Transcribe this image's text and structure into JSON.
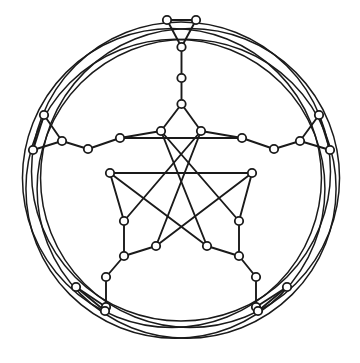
{
  "figure": {
    "kind": "graph-drawing",
    "background_color": "#ffffff",
    "stroke_color": "#1a1a1a",
    "node_fill_color": "#ffffff",
    "node_radius": 4.2,
    "edge_width": 1.9,
    "arc_width": 1.5,
    "symmetry_order": 5,
    "center": {
      "x": 181,
      "y": 181
    },
    "counts": {
      "nodes": 40,
      "straight_edges": 60,
      "arcs": 5
    }
  },
  "geometry": {
    "nodes": [
      {
        "id": "n0",
        "name": "top-tri-left",
        "x": 167.0,
        "y": 20.0
      },
      {
        "id": "n1",
        "name": "top-tri-right",
        "x": 196.0,
        "y": 20.0
      },
      {
        "id": "n2",
        "name": "top-tri-apex",
        "x": 181.5,
        "y": 47.0
      },
      {
        "id": "n3",
        "name": "top-spoke",
        "x": 181.5,
        "y": 78.0
      },
      {
        "id": "n4",
        "name": "star-tip-top",
        "x": 181.5,
        "y": 104.0
      },
      {
        "id": "n5",
        "name": "star-inner-tl",
        "x": 161.0,
        "y": 131.0
      },
      {
        "id": "n6",
        "name": "star-inner-tr",
        "x": 201.0,
        "y": 131.0
      },
      {
        "id": "n7",
        "name": "ring-a-upper-left",
        "x": 120.0,
        "y": 138.0
      },
      {
        "id": "n8",
        "name": "ring-a-upper-right",
        "x": 242.0,
        "y": 138.0
      },
      {
        "id": "n9",
        "name": "ring-b-left",
        "x": 110.0,
        "y": 173.0
      },
      {
        "id": "n10",
        "name": "ring-b-right",
        "x": 252.0,
        "y": 173.0
      },
      {
        "id": "n11",
        "name": "ring-c-lower-left",
        "x": 124.0,
        "y": 221.0
      },
      {
        "id": "n12",
        "name": "ring-c-lower-right",
        "x": 239.0,
        "y": 221.0
      },
      {
        "id": "n13",
        "name": "star-inner-bl",
        "x": 156.0,
        "y": 246.0
      },
      {
        "id": "n14",
        "name": "star-inner-br",
        "x": 207.0,
        "y": 246.0
      },
      {
        "id": "n15",
        "name": "ring-d-lower-left",
        "x": 124.0,
        "y": 256.0
      },
      {
        "id": "n16",
        "name": "ring-d-lower-right",
        "x": 239.0,
        "y": 256.0
      },
      {
        "id": "n17",
        "name": "hub-left-outer",
        "x": 88.0,
        "y": 149.0
      },
      {
        "id": "n18",
        "name": "hub-left-inner",
        "x": 62.0,
        "y": 141.0
      },
      {
        "id": "n19",
        "name": "hub-right-outer",
        "x": 274.0,
        "y": 149.0
      },
      {
        "id": "n20",
        "name": "hub-right-inner",
        "x": 300.0,
        "y": 141.0
      },
      {
        "id": "n21",
        "name": "left-tri-top",
        "x": 44.0,
        "y": 115.0
      },
      {
        "id": "n22",
        "name": "left-tri-bottom",
        "x": 33.0,
        "y": 150.0
      },
      {
        "id": "n23",
        "name": "right-tri-top",
        "x": 319.0,
        "y": 115.0
      },
      {
        "id": "n24",
        "name": "right-tri-bottom",
        "x": 330.0,
        "y": 150.0
      },
      {
        "id": "n25",
        "name": "hub-bl-upper",
        "x": 106.0,
        "y": 277.0
      },
      {
        "id": "n26",
        "name": "hub-bl-lower",
        "x": 106.0,
        "y": 307.0
      },
      {
        "id": "n27",
        "name": "hub-br-upper",
        "x": 256.0,
        "y": 277.0
      },
      {
        "id": "n28",
        "name": "hub-br-lower",
        "x": 256.0,
        "y": 307.0
      },
      {
        "id": "n29",
        "name": "bl-tri-outer",
        "x": 76.0,
        "y": 287.0
      },
      {
        "id": "n30",
        "name": "bl-tri-lower",
        "x": 105.0,
        "y": 311.0
      },
      {
        "id": "n31",
        "name": "br-tri-outer",
        "x": 287.0,
        "y": 287.0
      },
      {
        "id": "n32",
        "name": "br-tri-lower",
        "x": 258.0,
        "y": 311.0
      }
    ],
    "edges": [
      {
        "from": "n0",
        "to": "n1",
        "name": "edge-top-triangle-base"
      },
      {
        "from": "n0",
        "to": "n2",
        "name": "edge-top-triangle-left"
      },
      {
        "from": "n1",
        "to": "n2",
        "name": "edge-top-triangle-right"
      },
      {
        "from": "n2",
        "to": "n3",
        "name": "edge-top-spoke"
      },
      {
        "from": "n3",
        "to": "n4",
        "name": "edge-top-stem"
      },
      {
        "from": "n4",
        "to": "n5",
        "name": "edge-star-top-left"
      },
      {
        "from": "n4",
        "to": "n6",
        "name": "edge-star-top-right"
      },
      {
        "from": "n5",
        "to": "n7",
        "name": "edge-inner-tl-ring"
      },
      {
        "from": "n6",
        "to": "n8",
        "name": "edge-inner-tr-ring"
      },
      {
        "from": "n7",
        "to": "n8",
        "name": "edge-ring-a-horizontal"
      },
      {
        "from": "n9",
        "to": "n10",
        "name": "edge-ring-b-horizontal"
      },
      {
        "from": "n7",
        "to": "n17",
        "name": "edge-ring-a-left-hub"
      },
      {
        "from": "n8",
        "to": "n19",
        "name": "edge-ring-a-right-hub"
      },
      {
        "from": "n9",
        "to": "n11",
        "name": "edge-ring-b-left-down"
      },
      {
        "from": "n10",
        "to": "n12",
        "name": "edge-ring-b-right-down"
      },
      {
        "from": "n11",
        "to": "n15",
        "name": "edge-ring-c-left-down"
      },
      {
        "from": "n12",
        "to": "n16",
        "name": "edge-ring-c-right-down"
      },
      {
        "from": "n13",
        "to": "n15",
        "name": "edge-inner-bl-ring"
      },
      {
        "from": "n14",
        "to": "n16",
        "name": "edge-inner-br-ring"
      },
      {
        "from": "n15",
        "to": "n25",
        "name": "edge-ring-d-left-hub"
      },
      {
        "from": "n16",
        "to": "n27",
        "name": "edge-ring-d-right-hub"
      },
      {
        "from": "n5",
        "to": "n14",
        "name": "edge-pentagram-1"
      },
      {
        "from": "n6",
        "to": "n13",
        "name": "edge-pentagram-2"
      },
      {
        "from": "n9",
        "to": "n14",
        "name": "edge-pentagram-3"
      },
      {
        "from": "n10",
        "to": "n13",
        "name": "edge-pentagram-4"
      },
      {
        "from": "n5",
        "to": "n12",
        "name": "edge-pentagram-5"
      },
      {
        "from": "n6",
        "to": "n11",
        "name": "edge-pentagram-6"
      },
      {
        "from": "n17",
        "to": "n18",
        "name": "edge-left-hub"
      },
      {
        "from": "n19",
        "to": "n20",
        "name": "edge-right-hub"
      },
      {
        "from": "n18",
        "to": "n21",
        "name": "edge-left-tri-upper"
      },
      {
        "from": "n18",
        "to": "n22",
        "name": "edge-left-tri-lower"
      },
      {
        "from": "n21",
        "to": "n22",
        "name": "edge-left-tri-side"
      },
      {
        "from": "n20",
        "to": "n23",
        "name": "edge-right-tri-upper"
      },
      {
        "from": "n20",
        "to": "n24",
        "name": "edge-right-tri-lower"
      },
      {
        "from": "n23",
        "to": "n24",
        "name": "edge-right-tri-side"
      },
      {
        "from": "n25",
        "to": "n26",
        "name": "edge-bl-hub"
      },
      {
        "from": "n26",
        "to": "n29",
        "name": "edge-bl-tri-upper"
      },
      {
        "from": "n26",
        "to": "n30",
        "name": "edge-bl-tri-lower"
      },
      {
        "from": "n29",
        "to": "n30",
        "name": "edge-bl-tri-side"
      },
      {
        "from": "n27",
        "to": "n28",
        "name": "edge-br-hub"
      },
      {
        "from": "n28",
        "to": "n31",
        "name": "edge-br-tri-upper"
      },
      {
        "from": "n28",
        "to": "n32",
        "name": "edge-br-tri-lower"
      },
      {
        "from": "n31",
        "to": "n32",
        "name": "edge-br-tri-side"
      }
    ],
    "arcs": [
      {
        "name": "arc-1",
        "cx": 181.0,
        "cy": 188.0,
        "r": 152.0,
        "rotation": 0
      },
      {
        "name": "arc-2",
        "cx": 181.0,
        "cy": 188.0,
        "r": 152.0,
        "rotation": 72
      },
      {
        "name": "arc-3",
        "cx": 181.0,
        "cy": 188.0,
        "r": 152.0,
        "rotation": 144
      },
      {
        "name": "arc-4",
        "cx": 181.0,
        "cy": 188.0,
        "r": 152.0,
        "rotation": 216
      },
      {
        "name": "arc-5",
        "cx": 181.0,
        "cy": 188.0,
        "r": 152.0,
        "rotation": 288
      }
    ]
  }
}
